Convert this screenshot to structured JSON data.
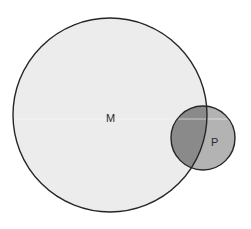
{
  "diagram": {
    "type": "venn",
    "sets": [
      {
        "id": "M",
        "label": "M",
        "cx": 110,
        "cy": 115,
        "r": 97,
        "fill": "#ececec"
      },
      {
        "id": "P",
        "label": "P",
        "cx": 203,
        "cy": 138,
        "r": 32,
        "fill": "#b3b3b3"
      }
    ],
    "intersection": {
      "sets": [
        "M",
        "P"
      ],
      "fill": "#8a8a8a"
    },
    "stroke": "#262626"
  }
}
